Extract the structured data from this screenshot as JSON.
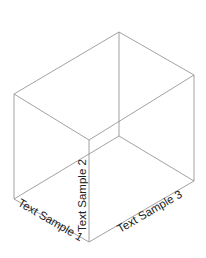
{
  "diagram": {
    "type": "isometric-box",
    "colors": {
      "edge": "#8a8a8a",
      "text": "#222222",
      "background": "#ffffff"
    },
    "vertices": {
      "top_back": [
        119,
        32
      ],
      "top_left": [
        14,
        94
      ],
      "top_right": [
        194,
        75
      ],
      "top_front": [
        89,
        140
      ],
      "bottom_back": [
        119,
        136
      ],
      "bottom_left": [
        14,
        199
      ],
      "bottom_right": [
        194,
        181
      ],
      "bottom_front": [
        89,
        242
      ]
    },
    "labels": {
      "axis1": "Text Sample 1",
      "axis2": "Text Sample 2",
      "axis3": "Text Sample 3"
    }
  }
}
